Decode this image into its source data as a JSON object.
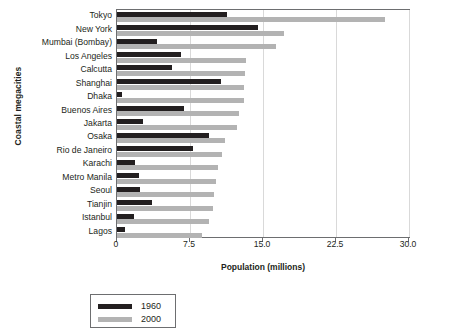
{
  "chart_data": {
    "type": "bar",
    "orientation": "horizontal",
    "title": "",
    "xlabel": "Population (millions)",
    "ylabel": "Coastal megacities",
    "xlim": [
      0,
      30.0
    ],
    "xticks": [
      "0",
      "7.5",
      "15.0",
      "22.5",
      "30.0"
    ],
    "xtick_values": [
      0,
      7.5,
      15.0,
      22.5,
      30.0
    ],
    "grid": true,
    "legend_position": "below-left",
    "categories": [
      "Tokyo",
      "New York",
      "Mumbai (Bombay)",
      "Los Angeles",
      "Calcutta",
      "Shanghai",
      "Dhaka",
      "Buenos Aires",
      "Jakarta",
      "Osaka",
      "Rio de Janeiro",
      "Karachi",
      "Metro Manila",
      "Seoul",
      "Tianjin",
      "Istanbul",
      "Lagos"
    ],
    "series": [
      {
        "name": "1960",
        "color": "#231f20",
        "values": [
          11.3,
          14.5,
          4.1,
          6.6,
          5.6,
          10.7,
          0.5,
          6.9,
          2.7,
          9.5,
          7.8,
          1.8,
          2.3,
          2.4,
          3.6,
          1.7,
          0.8
        ]
      },
      {
        "name": "2000",
        "color": "#b3b3b3",
        "values": [
          27.5,
          17.2,
          16.3,
          13.3,
          13.1,
          13.0,
          13.0,
          12.5,
          12.3,
          11.1,
          10.8,
          10.4,
          10.2,
          10.0,
          9.9,
          9.5,
          8.7
        ]
      }
    ]
  },
  "legend": {
    "items": [
      {
        "label": "1960",
        "color": "#231f20"
      },
      {
        "label": "2000",
        "color": "#b3b3b3"
      }
    ]
  }
}
